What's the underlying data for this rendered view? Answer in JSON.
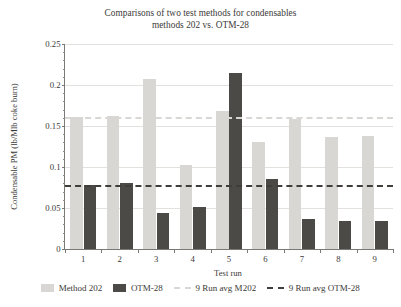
{
  "chart_data": {
    "type": "bar",
    "title": "Comparisons of two test methods for condensables",
    "subtitle": "methods 202 vs. OTM-28",
    "xlabel": "Test run",
    "ylabel": "Condensable PM (lb/Mlb coke burn)",
    "categories": [
      "1",
      "2",
      "3",
      "4",
      "5",
      "6",
      "7",
      "8",
      "9"
    ],
    "ylim": [
      0,
      0.25
    ],
    "ytick_labels": [
      "0",
      "0.05",
      "0.1",
      "0.15",
      "0.2",
      "0.25"
    ],
    "ytick_values": [
      0,
      0.05,
      0.1,
      0.15,
      0.2,
      0.25
    ],
    "grid": "horizontal",
    "legend_position": "bottom",
    "series": [
      {
        "name": "Method 202",
        "color": "#d8d7d3",
        "values": [
          0.161,
          0.162,
          0.207,
          0.103,
          0.168,
          0.13,
          0.159,
          0.137,
          0.138
        ]
      },
      {
        "name": "OTM-28",
        "color": "#4b4a47",
        "values": [
          0.078,
          0.08,
          0.044,
          0.051,
          0.215,
          0.085,
          0.036,
          0.034,
          0.034
        ]
      }
    ],
    "reference_lines": [
      {
        "name": "9 Run avg M202",
        "value": 0.161,
        "color": "#d8d7d3",
        "style": "dashed"
      },
      {
        "name": "9 Run avg OTM-28",
        "value": 0.078,
        "color": "#3f3e3b",
        "style": "dashed"
      }
    ],
    "legend": [
      {
        "label": "Method 202",
        "kind": "swatch",
        "variant": "m202"
      },
      {
        "label": "OTM-28",
        "kind": "swatch",
        "variant": "otm28"
      },
      {
        "label": "9 Run avg M202",
        "kind": "dash",
        "variant": "m202"
      },
      {
        "label": "9 Run avg OTM-28",
        "kind": "dash",
        "variant": "otm28"
      }
    ]
  }
}
